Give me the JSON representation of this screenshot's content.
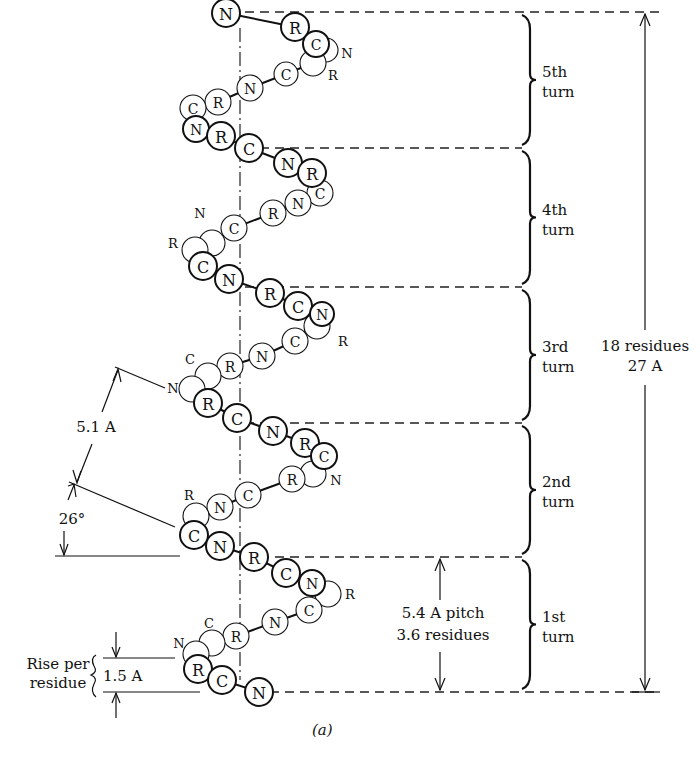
{
  "figure": {
    "caption": "(a)",
    "total_label": [
      "18 residues",
      "27 A"
    ],
    "pitch_label": [
      "5.4 A pitch",
      "3.6 residues"
    ],
    "rise_label": [
      "Rise per",
      "residue"
    ],
    "rise_value": "1.5 A",
    "spacing_label": "5.1 A",
    "angle_label": "26°",
    "turns": [
      {
        "name": "5th turn",
        "lines": [
          "5th",
          "turn"
        ],
        "top": 12,
        "bottom": 148
      },
      {
        "name": "4th turn",
        "lines": [
          "4th",
          "turn"
        ],
        "top": 148,
        "bottom": 287
      },
      {
        "name": "3rd turn",
        "lines": [
          "3rd",
          "turn"
        ],
        "top": 287,
        "bottom": 423
      },
      {
        "name": "2nd turn",
        "lines": [
          "2nd",
          "turn"
        ],
        "top": 423,
        "bottom": 557
      },
      {
        "name": "1st turn",
        "lines": [
          "1st",
          "turn"
        ],
        "top": 557,
        "bottom": 692
      }
    ],
    "atoms": [
      {
        "l": "N",
        "x": 226,
        "y": 13,
        "r": 14,
        "f": 1
      },
      {
        "l": "R",
        "x": 295,
        "y": 27,
        "r": 14,
        "f": 1
      },
      {
        "l": "C",
        "x": 316,
        "y": 44,
        "r": 13,
        "f": 1
      },
      {
        "l": "",
        "x": 326,
        "y": 50,
        "r": 12,
        "f": 0
      },
      {
        "l": "",
        "x": 313,
        "y": 63,
        "r": 13,
        "f": 0
      },
      {
        "l": "C",
        "x": 286,
        "y": 74,
        "r": 12,
        "f": 0
      },
      {
        "l": "N",
        "x": 250,
        "y": 88,
        "r": 13,
        "f": 0
      },
      {
        "l": "R",
        "x": 218,
        "y": 102,
        "r": 13,
        "f": 0
      },
      {
        "l": "C",
        "x": 193,
        "y": 108,
        "r": 13,
        "f": 0
      },
      {
        "l": "N",
        "x": 196,
        "y": 129,
        "r": 13,
        "f": 1
      },
      {
        "l": "R",
        "x": 221,
        "y": 136,
        "r": 14,
        "f": 1
      },
      {
        "l": "C",
        "x": 249,
        "y": 148,
        "r": 14,
        "f": 1
      },
      {
        "l": "N",
        "x": 288,
        "y": 163,
        "r": 14,
        "f": 1
      },
      {
        "l": "R",
        "x": 312,
        "y": 173,
        "r": 14,
        "f": 1
      },
      {
        "l": "C",
        "x": 320,
        "y": 193,
        "r": 13,
        "f": 0
      },
      {
        "l": "N",
        "x": 298,
        "y": 203,
        "r": 13,
        "f": 0
      },
      {
        "l": "R",
        "x": 273,
        "y": 213,
        "r": 13,
        "f": 0
      },
      {
        "l": "C",
        "x": 234,
        "y": 228,
        "r": 13,
        "f": 0
      },
      {
        "l": "",
        "x": 212,
        "y": 243,
        "r": 13,
        "f": 0
      },
      {
        "l": "",
        "x": 195,
        "y": 250,
        "r": 13,
        "f": 0
      },
      {
        "l": "C",
        "x": 203,
        "y": 266,
        "r": 14,
        "f": 1
      },
      {
        "l": "N",
        "x": 229,
        "y": 279,
        "r": 14,
        "f": 1
      },
      {
        "l": "R",
        "x": 270,
        "y": 293,
        "r": 14,
        "f": 1
      },
      {
        "l": "C",
        "x": 298,
        "y": 306,
        "r": 14,
        "f": 1
      },
      {
        "l": "",
        "x": 317,
        "y": 326,
        "r": 13,
        "f": 0
      },
      {
        "l": "N",
        "x": 322,
        "y": 314,
        "r": 12,
        "f": 1
      },
      {
        "l": "C",
        "x": 295,
        "y": 341,
        "r": 13,
        "f": 0
      },
      {
        "l": "N",
        "x": 262,
        "y": 356,
        "r": 13,
        "f": 0
      },
      {
        "l": "R",
        "x": 230,
        "y": 366,
        "r": 13,
        "f": 0
      },
      {
        "l": "",
        "x": 208,
        "y": 376,
        "r": 13,
        "f": 0
      },
      {
        "l": "",
        "x": 192,
        "y": 389,
        "r": 13,
        "f": 0
      },
      {
        "l": "R",
        "x": 208,
        "y": 403,
        "r": 14,
        "f": 1
      },
      {
        "l": "C",
        "x": 237,
        "y": 418,
        "r": 14,
        "f": 1
      },
      {
        "l": "N",
        "x": 273,
        "y": 431,
        "r": 14,
        "f": 1
      },
      {
        "l": "R",
        "x": 305,
        "y": 443,
        "r": 14,
        "f": 1
      },
      {
        "l": "C",
        "x": 324,
        "y": 456,
        "r": 13,
        "f": 1
      },
      {
        "l": "",
        "x": 313,
        "y": 474,
        "r": 13,
        "f": 0
      },
      {
        "l": "R",
        "x": 292,
        "y": 479,
        "r": 13,
        "f": 0
      },
      {
        "l": "C",
        "x": 248,
        "y": 495,
        "r": 13,
        "f": 0
      },
      {
        "l": "N",
        "x": 220,
        "y": 507,
        "r": 13,
        "f": 0
      },
      {
        "l": "",
        "x": 196,
        "y": 516,
        "r": 13,
        "f": 0
      },
      {
        "l": "C",
        "x": 194,
        "y": 535,
        "r": 14,
        "f": 1
      },
      {
        "l": "N",
        "x": 220,
        "y": 546,
        "r": 14,
        "f": 1
      },
      {
        "l": "R",
        "x": 254,
        "y": 557,
        "r": 14,
        "f": 1
      },
      {
        "l": "C",
        "x": 286,
        "y": 573,
        "r": 14,
        "f": 1
      },
      {
        "l": "N",
        "x": 312,
        "y": 583,
        "r": 13,
        "f": 1
      },
      {
        "l": "",
        "x": 328,
        "y": 594,
        "r": 13,
        "f": 0
      },
      {
        "l": "C",
        "x": 309,
        "y": 610,
        "r": 13,
        "f": 0
      },
      {
        "l": "N",
        "x": 275,
        "y": 622,
        "r": 13,
        "f": 0
      },
      {
        "l": "R",
        "x": 236,
        "y": 636,
        "r": 13,
        "f": 0
      },
      {
        "l": "",
        "x": 212,
        "y": 643,
        "r": 13,
        "f": 0
      },
      {
        "l": "",
        "x": 196,
        "y": 654,
        "r": 13,
        "f": 0
      },
      {
        "l": "R",
        "x": 198,
        "y": 669,
        "r": 14,
        "f": 1
      },
      {
        "l": "C",
        "x": 222,
        "y": 680,
        "r": 14,
        "f": 1
      },
      {
        "l": "N",
        "x": 259,
        "y": 692,
        "r": 14,
        "f": 1
      }
    ],
    "side_labels": [
      {
        "l": "N",
        "x": 347,
        "y": 53
      },
      {
        "l": "R",
        "x": 333,
        "y": 75
      },
      {
        "l": "N",
        "x": 200,
        "y": 213
      },
      {
        "l": "R",
        "x": 173,
        "y": 243
      },
      {
        "l": "R",
        "x": 343,
        "y": 341
      },
      {
        "l": "C",
        "x": 190,
        "y": 359
      },
      {
        "l": "N",
        "x": 173,
        "y": 388
      },
      {
        "l": "N",
        "x": 336,
        "y": 480
      },
      {
        "l": "R",
        "x": 189,
        "y": 495
      },
      {
        "l": "R",
        "x": 350,
        "y": 594
      },
      {
        "l": "C",
        "x": 209,
        "y": 623
      },
      {
        "l": "N",
        "x": 179,
        "y": 643
      }
    ]
  }
}
